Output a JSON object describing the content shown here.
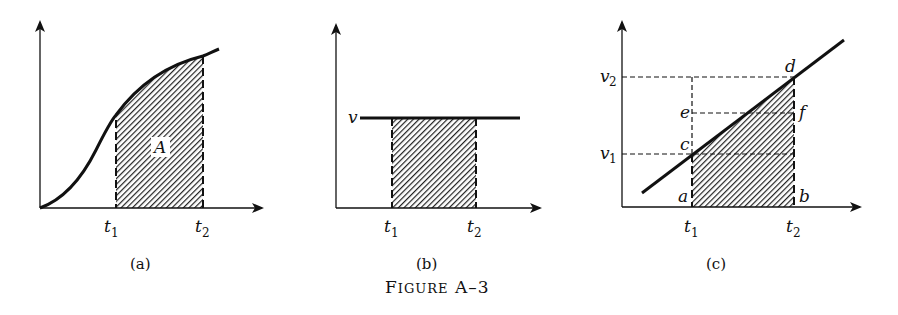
{
  "figure": {
    "title": "Figure A–3",
    "title_small_caps": "FIGURE A–3"
  },
  "panels": [
    {
      "id": "a",
      "caption": "(a)",
      "x_ticks": [
        {
          "base": "t",
          "sub": "1"
        },
        {
          "base": "t",
          "sub": "2"
        }
      ],
      "area_label": "A",
      "description": "Increasing S-shaped curve; hatched area A under curve between t1 and t2"
    },
    {
      "id": "b",
      "caption": "(b)",
      "y_label": "v",
      "x_ticks": [
        {
          "base": "t",
          "sub": "1"
        },
        {
          "base": "t",
          "sub": "2"
        }
      ],
      "description": "Constant horizontal line at v; hatched rectangle between t1 and t2"
    },
    {
      "id": "c",
      "caption": "(c)",
      "y_labels": [
        {
          "base": "v",
          "sub": "2"
        },
        {
          "base": "v",
          "sub": "1"
        }
      ],
      "x_ticks": [
        {
          "base": "t",
          "sub": "1"
        },
        {
          "base": "t",
          "sub": "2"
        }
      ],
      "points": [
        "a",
        "b",
        "c",
        "d",
        "e",
        "f"
      ],
      "description": "Straight increasing line; hatched trapezoid a-b-d-c under line between t1 and t2 with dashed guides at v1, v2 and midpoint e-f"
    }
  ],
  "colors": {
    "ink": "#111111",
    "background": "#ffffff"
  }
}
